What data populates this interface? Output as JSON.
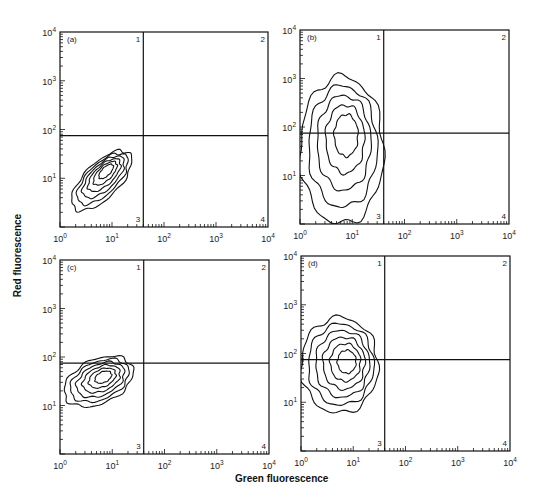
{
  "figure": {
    "ylabel": "Red fluorescence",
    "xlabel": "Green fluorescence",
    "colors": {
      "line": "#111111",
      "background": "#ffffff"
    }
  },
  "chart_data": [
    {
      "type": "contour",
      "panel_label": "(a)",
      "xlabel": "Green fluorescence",
      "ylabel": "Red fluorescence",
      "xscale": "log",
      "yscale": "log",
      "xlim": [
        1,
        10000
      ],
      "ylim": [
        1,
        10000
      ],
      "x_ticks": [
        "10^0",
        "10^1",
        "10^2",
        "10^3",
        "10^4"
      ],
      "y_ticks": [
        "10^0",
        "10^1",
        "10^2",
        "10^3",
        "10^4"
      ],
      "quadrant_gate": {
        "x": 40,
        "y": 75
      },
      "quadrant_labels": [
        "1",
        "2",
        "3",
        "4"
      ],
      "population": {
        "center": [
          8,
          15
        ],
        "shape": "diagonal ellipse",
        "x_range": [
          1,
          40
        ],
        "y_range": [
          1,
          80
        ],
        "contour_levels": 6
      },
      "note": "Population confined to quadrant 3, elongated along diagonal"
    },
    {
      "type": "contour",
      "panel_label": "(b)",
      "xlabel": "Green fluorescence",
      "ylabel": "Red fluorescence",
      "xscale": "log",
      "yscale": "log",
      "xlim": [
        1,
        10000
      ],
      "ylim": [
        1,
        10000
      ],
      "x_ticks": [
        "10^0",
        "10^1",
        "10^2",
        "10^3",
        "10^4"
      ],
      "y_ticks": [
        "10^0",
        "10^1",
        "10^2",
        "10^3",
        "10^4"
      ],
      "quadrant_gate": {
        "x": 40,
        "y": 75
      },
      "quadrant_labels": [
        "1",
        "2",
        "3",
        "4"
      ],
      "population": {
        "center": [
          8,
          80
        ],
        "shape": "vertical ellipse",
        "x_range": [
          1,
          40
        ],
        "y_range": [
          1,
          1100
        ],
        "contour_levels": 5
      },
      "note": "Population spans quadrants 1 and 3"
    },
    {
      "type": "contour",
      "panel_label": "(c)",
      "xlabel": "Green fluorescence",
      "ylabel": "Red fluorescence",
      "xscale": "log",
      "yscale": "log",
      "xlim": [
        1,
        10000
      ],
      "ylim": [
        1,
        10000
      ],
      "x_ticks": [
        "10^0",
        "10^1",
        "10^2",
        "10^3",
        "10^4"
      ],
      "y_ticks": [
        "10^0",
        "10^1",
        "10^2",
        "10^3",
        "10^4"
      ],
      "quadrant_gate": {
        "x": 40,
        "y": 75
      },
      "quadrant_labels": [
        "1",
        "2",
        "3",
        "4"
      ],
      "population": {
        "center": [
          7,
          40
        ],
        "shape": "tilted ellipse",
        "x_range": [
          1,
          30
        ],
        "y_range": [
          7,
          140
        ],
        "contour_levels": 6
      },
      "note": "Population mostly in quadrant 3, slightly crossing into quadrant 1"
    },
    {
      "type": "contour",
      "panel_label": "(d)",
      "xlabel": "Green fluorescence",
      "ylabel": "Red fluorescence",
      "xscale": "log",
      "yscale": "log",
      "xlim": [
        1,
        10000
      ],
      "ylim": [
        1,
        10000
      ],
      "x_ticks": [
        "10^0",
        "10^1",
        "10^2",
        "10^3",
        "10^4"
      ],
      "y_ticks": [
        "10^0",
        "10^1",
        "10^2",
        "10^3",
        "10^4"
      ],
      "quadrant_gate": {
        "x": 40,
        "y": 75
      },
      "quadrant_labels": [
        "1",
        "2",
        "3",
        "4"
      ],
      "population": {
        "center": [
          8,
          70
        ],
        "shape": "ellipse",
        "x_range": [
          1,
          30
        ],
        "y_range": [
          6,
          550
        ],
        "contour_levels": 6
      },
      "note": "Population spans quadrants 1 and 3"
    }
  ]
}
